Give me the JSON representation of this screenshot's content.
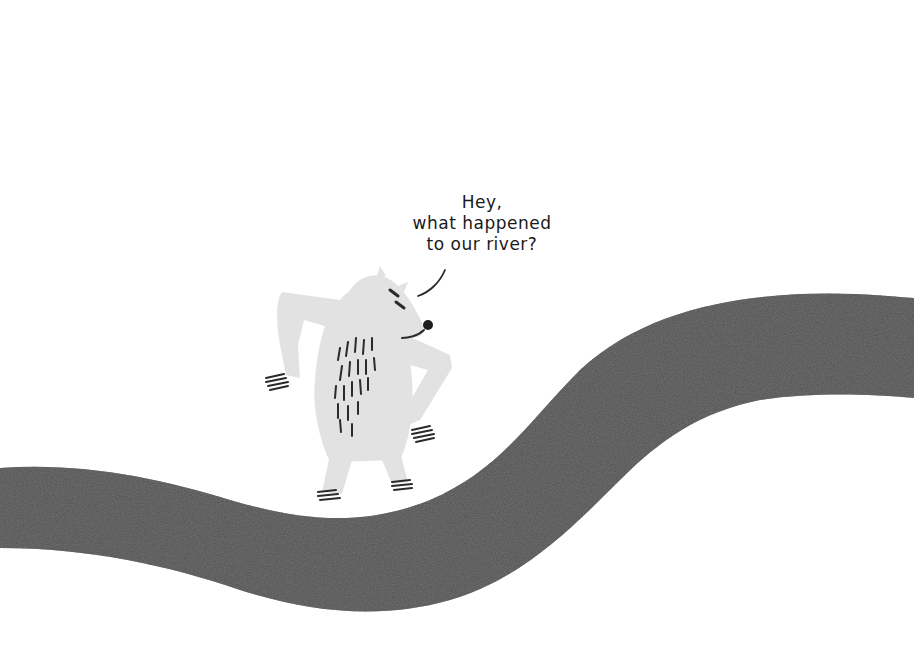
{
  "illustration": {
    "speech_bubble": {
      "lines": [
        "Hey,",
        "what happened",
        "to our river?"
      ]
    },
    "characters": [
      {
        "name": "polar-bear",
        "pose": "hands on hips, looking at river"
      }
    ],
    "elements": [
      {
        "name": "dry-river",
        "description": "dark speckled winding riverbed across page"
      }
    ],
    "colors": {
      "background": "#ffffff",
      "bear": "#e0e0e0",
      "river": "#4a4a4a",
      "ink": "#1a1a1a"
    }
  }
}
